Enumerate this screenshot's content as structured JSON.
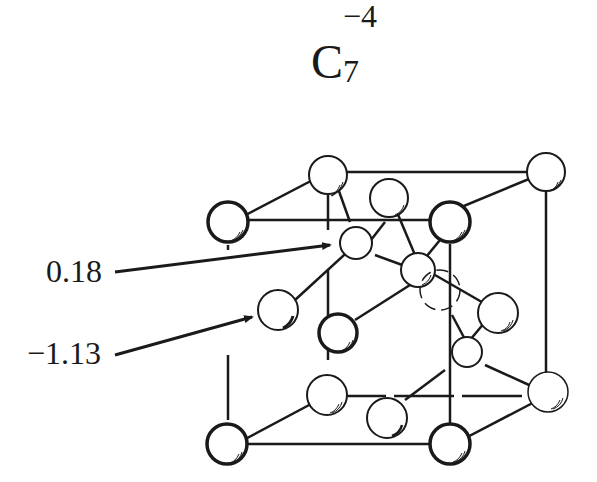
{
  "title": {
    "base": "C",
    "subscript": "7",
    "superscript": "−4"
  },
  "labels": [
    {
      "text": "0.18",
      "target": "interior-atom-upper"
    },
    {
      "text": "−1.13",
      "target": "interior-atom-left"
    }
  ],
  "diagram": {
    "type": "crystal-lattice-unit-cell"
  },
  "colors": {
    "ink": "#1a1a1a",
    "background": "#ffffff"
  }
}
